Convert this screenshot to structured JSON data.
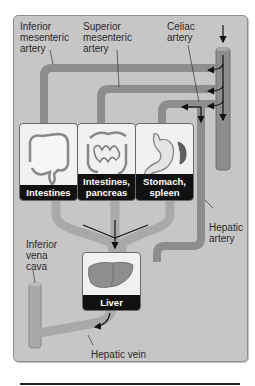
{
  "diagram": {
    "labels": {
      "inferior_mesenteric_artery": "Inferior mesenteric artery",
      "superior_mesenteric_artery": "Superior mesenteric artery",
      "celiac_artery": "Celiac artery",
      "hepatic_artery": "Hepatic artery",
      "inferior_vena_cava": "Inferior vena cava",
      "hepatic_vein": "Hepatic vein"
    },
    "label_lines": {
      "ima": [
        "Inferior",
        "mesenteric",
        "artery"
      ],
      "sma": [
        "Superior",
        "mesenteric",
        "artery"
      ],
      "celiac": [
        "Celiac",
        "artery"
      ],
      "hepatic_artery": [
        "Hepatic",
        "artery"
      ],
      "ivc": [
        "Inferior",
        "vena",
        "cava"
      ],
      "hepatic_vein": "Hepatic vein"
    },
    "organs": [
      {
        "name": "Intestines",
        "caption_lines": [
          "Intestines"
        ]
      },
      {
        "name": "Intestines, pancreas",
        "caption_lines": [
          "Intestines,",
          "pancreas"
        ]
      },
      {
        "name": "Stomach, spleen",
        "caption_lines": [
          "Stomach,",
          "spleen"
        ]
      },
      {
        "name": "Liver",
        "caption_lines": [
          "Liver"
        ]
      }
    ],
    "colors": {
      "background_panel": "#c6c6c6",
      "vessel": "#8d8d8d",
      "vessel_edge": "#6f6f6f",
      "vein_light": "#a9a9a9",
      "caption_bg": "#111111",
      "caption_text": "#ffffff",
      "arrow": "#111111"
    }
  }
}
